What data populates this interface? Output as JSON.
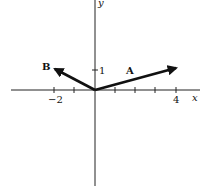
{
  "diagram": {
    "type": "vector-diagram",
    "axes": {
      "x_label": "x",
      "y_label": "y",
      "x_ticks": [
        -2,
        -1,
        1,
        2,
        3,
        4
      ],
      "x_tick_labels": {
        "-2": "−2",
        "4": "4"
      },
      "y_ticks": [
        1
      ],
      "y_tick_labels": {
        "1": "1"
      }
    },
    "vectors": [
      {
        "name": "A",
        "label": "A",
        "from": [
          0,
          0
        ],
        "to": [
          4,
          1
        ]
      },
      {
        "name": "B",
        "label": "B",
        "from": [
          0,
          0
        ],
        "to": [
          -2,
          1
        ]
      }
    ],
    "labels": {
      "vector_a": "A",
      "vector_b": "B",
      "x_axis": "x",
      "y_axis": "y",
      "tick_neg2": "−2",
      "tick_4": "4",
      "tick_y1": "1"
    },
    "colors": {
      "ink": "#111111",
      "background": "#ffffff"
    }
  }
}
